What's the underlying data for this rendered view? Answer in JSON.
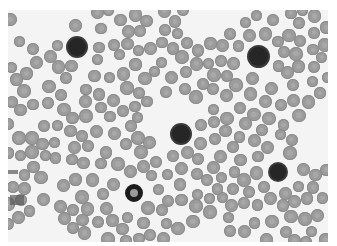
{
  "image": {
    "subject": "Peripheral blood smear micrograph (grayscale)",
    "frame": {
      "x": 8,
      "y": 10,
      "width": 320,
      "height": 232
    },
    "background_color": "#f4f4f4",
    "rbc_color": "#9c9c9c",
    "dark_cell_color": "#262626",
    "dark_cells": [
      {
        "x": 77,
        "y": 47,
        "d": 18,
        "type": "solid"
      },
      {
        "x": 258,
        "y": 56,
        "d": 19,
        "type": "solid"
      },
      {
        "x": 181,
        "y": 134,
        "d": 18,
        "type": "solid"
      },
      {
        "x": 278,
        "y": 172,
        "d": 16,
        "type": "solid"
      },
      {
        "x": 134,
        "y": 193,
        "d": 18,
        "type": "ring"
      }
    ]
  }
}
